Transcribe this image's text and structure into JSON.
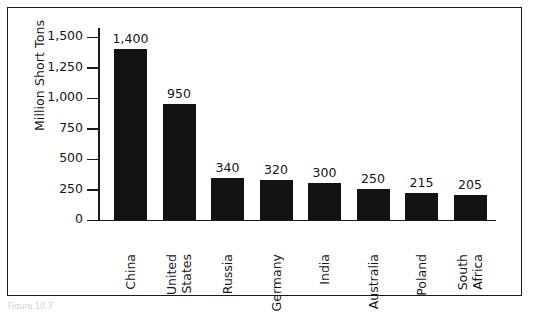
{
  "figure": {
    "caption": "Figure 10.7"
  },
  "chart_data": {
    "type": "bar",
    "title": "",
    "xlabel": "",
    "ylabel": "Million Short Tons",
    "ylim": [
      0,
      1500
    ],
    "grid": false,
    "legend": false,
    "categories": [
      "China",
      "United States",
      "Russia",
      "Germany",
      "India",
      "Australia",
      "Poland",
      "South Africa"
    ],
    "category_lines": [
      [
        "China"
      ],
      [
        "United",
        "States"
      ],
      [
        "Russia"
      ],
      [
        "Germany"
      ],
      [
        "India"
      ],
      [
        "Australia"
      ],
      [
        "Poland"
      ],
      [
        "South",
        "Africa"
      ]
    ],
    "values": [
      1400,
      950,
      340,
      320,
      300,
      250,
      215,
      205
    ],
    "value_labels": [
      "1,400",
      "950",
      "340",
      "320",
      "300",
      "250",
      "215",
      "205"
    ],
    "yticks": [
      0,
      250,
      500,
      750,
      1000,
      1250,
      1500
    ],
    "ytick_labels": [
      "0",
      "250",
      "500",
      "750",
      "1,000",
      "1,250",
      "1,500"
    ],
    "bar_color": "#121212",
    "axis_color": "#1a1a1a",
    "background_color": "#ffffff"
  }
}
